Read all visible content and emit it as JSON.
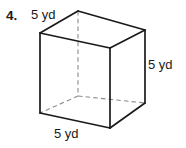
{
  "figure": {
    "problem_number": "4.",
    "shape_name": "cube",
    "labels": {
      "top_edge": "5 yd",
      "right_edge": "5 yd",
      "bottom_edge": "5 yd"
    },
    "colors": {
      "stroke": "#1a1a1a",
      "hidden_stroke": "#8c8c8c",
      "background": "#ffffff",
      "text": "#1a1a1a"
    },
    "geometry": {
      "front_top_left": "40,33",
      "front_top_right": "110,48",
      "front_bottom_right": "110,128",
      "front_bottom_left": "40,113",
      "back_top_left": "78,11",
      "back_top_right": "145,30",
      "back_bottom_right": "145,103",
      "back_bottom_left": "78,96",
      "visible_edges": "solid",
      "hidden_edges": "dashed"
    },
    "measurements": {
      "edge_length": 5,
      "unit": "yd",
      "unit_name": "yards"
    }
  }
}
